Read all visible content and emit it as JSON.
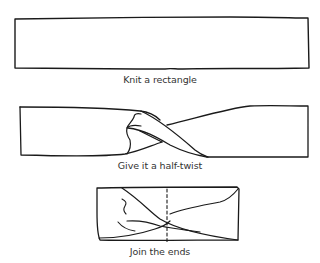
{
  "diagram": {
    "steps": [
      {
        "id": "step-1",
        "caption": "Knit a rectangle"
      },
      {
        "id": "step-2",
        "caption": "Give it a half-twist"
      },
      {
        "id": "step-3",
        "caption": "Join the ends"
      }
    ],
    "colors": {
      "stroke": "#1a1a1a",
      "text": "#333333",
      "background": "#ffffff"
    }
  }
}
